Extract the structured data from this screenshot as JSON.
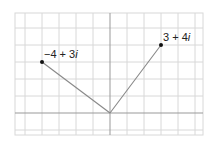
{
  "diagram": {
    "type": "complex-plane",
    "unit_range": {
      "real": [
        -5.5,
        5.5
      ],
      "imag": [
        -1.3,
        5.9
      ]
    },
    "points": [
      {
        "label_main": "−4 + 3",
        "label_i": "i",
        "re": -4,
        "im": 3
      },
      {
        "label_main": "3 + 4",
        "label_i": "i",
        "re": 3,
        "im": 4
      }
    ],
    "segments": [
      {
        "from": [
          0,
          0
        ],
        "to": [
          -4,
          3
        ]
      },
      {
        "from": [
          0,
          0
        ],
        "to": [
          3,
          4
        ]
      }
    ],
    "colors": {
      "grid": "#d8d8d8",
      "axis": "#999999",
      "segment": "#888888",
      "point": "#111111"
    }
  }
}
